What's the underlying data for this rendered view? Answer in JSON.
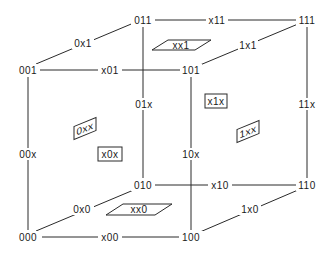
{
  "diagram": {
    "vertices": {
      "v000": "000",
      "v001": "001",
      "v010": "010",
      "v011": "011",
      "v100": "100",
      "v101": "101",
      "v110": "110",
      "v111": "111"
    },
    "edges": {
      "e00x": "00x",
      "e01x": "01x",
      "e10x": "10x",
      "e11x": "11x",
      "e0x0": "0x0",
      "e0x1": "0x1",
      "e1x0": "1x0",
      "e1x1": "1x1",
      "ex00": "x00",
      "ex01": "x01",
      "ex10": "x10",
      "ex11": "x11"
    },
    "faces": {
      "f0xx": "0xx",
      "f1xx": "1xx",
      "fx0x": "x0x",
      "fx1x": "x1x",
      "fxx0": "xx0",
      "fxx1": "xx1"
    }
  }
}
